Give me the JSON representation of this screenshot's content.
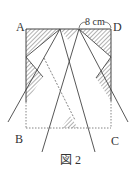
{
  "figure": {
    "caption": "図 2",
    "vertex_labels": {
      "A": "A",
      "B": "B",
      "C": "C",
      "D": "D"
    },
    "dimension_label": "8 cm",
    "colors": {
      "stroke": "#444444",
      "hatch": "#555555",
      "background": "#ffffff"
    }
  }
}
